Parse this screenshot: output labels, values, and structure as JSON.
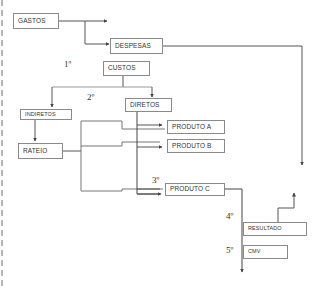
{
  "diagram": {
    "boxes": {
      "gastos": "GASTOS",
      "despesas": "DESPESAS",
      "custos": "CUSTOS",
      "indiretos": "INDIRETOS",
      "diretos": "DIRETOS",
      "rateio": "RATEIO",
      "produto_a": "PRODUTO A",
      "produto_b": "PRODUTO B",
      "produto_c": "PRODUTO C",
      "resultado": "RESULTADO",
      "cmv": "CMV"
    },
    "steps": {
      "s1": "1º",
      "s2": "2º",
      "s3": "3º",
      "s4": "4º",
      "s5": "5º"
    },
    "colors": {
      "line": "#555555",
      "box_border": "#8a8a8a",
      "text": "#333333",
      "dashed_border": "#b5b5b5"
    }
  }
}
